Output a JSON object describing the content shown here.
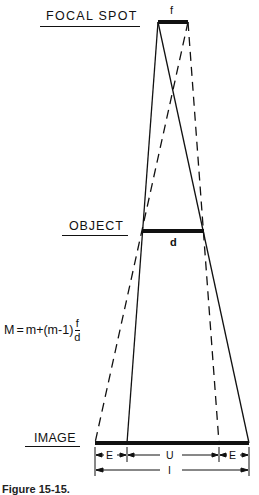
{
  "diagram": {
    "labels": {
      "focal_spot": "FOCAL SPOT",
      "object": "OBJECT",
      "image": "IMAGE"
    },
    "variables": {
      "focal_size": "f",
      "object_size": "d"
    },
    "formula": {
      "lhs": "M",
      "equals": "=",
      "rhs_prefix": "m+(m-1)",
      "fraction_numerator": "f",
      "fraction_denominator": "d"
    },
    "dimensions": {
      "edge_left": "E",
      "umbra": "U",
      "edge_right": "E",
      "total_image": "I"
    },
    "caption": "Figure 15-15."
  },
  "geometry": {
    "focal_spot_bar": {
      "x1": 158,
      "x2": 188,
      "y": 22
    },
    "object_bar": {
      "x1": 142,
      "x2": 204,
      "y": 231
    },
    "image_bar": {
      "x1": 95,
      "x2": 249,
      "y": 443
    },
    "rays": [
      {
        "style": "solid",
        "from": [
          158,
          22
        ],
        "to": [
          127,
          443
        ]
      },
      {
        "style": "solid",
        "from": [
          158,
          22
        ],
        "to": [
          249,
          443
        ]
      },
      {
        "style": "dashed",
        "from": [
          188,
          22
        ],
        "to": [
          95,
          443
        ]
      },
      {
        "style": "dashed",
        "from": [
          188,
          22
        ],
        "to": [
          219,
          443
        ]
      }
    ]
  }
}
